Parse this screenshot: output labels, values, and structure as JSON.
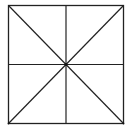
{
  "diagram": {
    "type": "geometric-figure",
    "square": {
      "x1": 8.5,
      "y1": 5.5,
      "x2": 123.5,
      "y2": 123.5
    },
    "center": {
      "x": 66,
      "y": 64.5
    },
    "stroke_color": "#222222",
    "background_color": "#ffffff",
    "lines": [
      {
        "name": "diagonal-tl-br",
        "x1": 8.5,
        "y1": 5.5,
        "x2": 123.5,
        "y2": 123.5
      },
      {
        "name": "diagonal-tr-bl",
        "x1": 123.5,
        "y1": 5.5,
        "x2": 8.5,
        "y2": 123.5
      },
      {
        "name": "vertical-midline",
        "x1": 66,
        "y1": 5.5,
        "x2": 66,
        "y2": 123.5
      },
      {
        "name": "horizontal-midline",
        "x1": 8.5,
        "y1": 64.5,
        "x2": 123.5,
        "y2": 64.5
      }
    ]
  }
}
